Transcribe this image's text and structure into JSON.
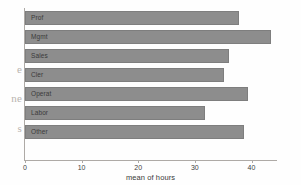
{
  "margin_fragments": [
    "e",
    "ne",
    "s"
  ],
  "chart_data": {
    "type": "bar",
    "orientation": "horizontal",
    "title": "",
    "xlabel": "mean of hours",
    "ylabel": "",
    "categories": [
      "Prof",
      "Mgmt",
      "Sales",
      "Cler",
      "Operat",
      "Labor",
      "Other"
    ],
    "values": [
      37.8,
      43.5,
      36.0,
      35.2,
      39.3,
      31.8,
      38.6
    ],
    "xlim": [
      0,
      44.5
    ],
    "xticks": [
      0,
      10,
      20,
      30,
      40
    ],
    "xtick_labels": [
      "0",
      "10",
      "20",
      "30",
      "40"
    ],
    "grid": false,
    "legend": null,
    "bar_color": "#8d8d8d",
    "bar_edge_color": "#7e7e7e",
    "axis_color": "#aeaaa6",
    "background": "#fefefe"
  }
}
